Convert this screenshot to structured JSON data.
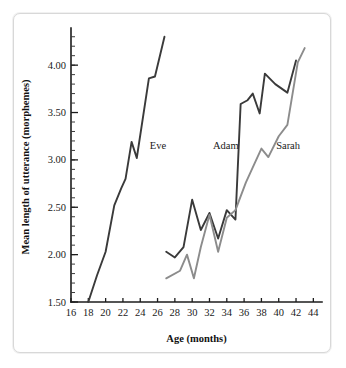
{
  "figure": {
    "frame_color": "#d8d8d8",
    "background": "#ffffff"
  },
  "axis": {
    "x_title": "Age (months)",
    "y_title": "Mean length of utterance (morphemes)",
    "x_ticks": [
      "16",
      "18",
      "20",
      "22",
      "24",
      "26",
      "28",
      "30",
      "32",
      "34",
      "36",
      "38",
      "40",
      "42",
      "44"
    ],
    "y_ticks": [
      "1.50",
      "2.00",
      "2.50",
      "3.00",
      "3.50",
      "4.00"
    ]
  },
  "labels": {
    "eve": "Eve",
    "adam": "Adam",
    "sarah": "Sarah"
  },
  "chart_data": {
    "type": "line",
    "title": "",
    "xlabel": "Age (months)",
    "ylabel": "Mean length of utterance (morphemes)",
    "xlim": [
      16,
      45
    ],
    "ylim": [
      1.5,
      4.35
    ],
    "xticks": [
      16,
      18,
      20,
      22,
      24,
      26,
      28,
      30,
      32,
      34,
      36,
      38,
      40,
      42,
      44
    ],
    "yticks": [
      1.5,
      2.0,
      2.5,
      3.0,
      3.5,
      4.0
    ],
    "y_minor_step": 0.1,
    "grid": false,
    "legend": "inline-labels",
    "series": [
      {
        "name": "Eve",
        "color": "#3a3a3a",
        "label_x": 25.1,
        "label_y": 3.12,
        "points": [
          [
            18.0,
            1.5
          ],
          [
            19.0,
            1.78
          ],
          [
            20.0,
            2.03
          ],
          [
            21.0,
            2.52
          ],
          [
            21.8,
            2.7
          ],
          [
            22.3,
            2.8
          ],
          [
            23.0,
            3.19
          ],
          [
            23.6,
            3.02
          ],
          [
            25.0,
            3.86
          ],
          [
            25.7,
            3.88
          ],
          [
            26.8,
            4.3
          ]
        ]
      },
      {
        "name": "Adam",
        "color": "#3a3a3a",
        "label_x": 32.4,
        "label_y": 3.12,
        "points": [
          [
            27.0,
            2.03
          ],
          [
            28.0,
            1.97
          ],
          [
            29.0,
            2.08
          ],
          [
            30.0,
            2.58
          ],
          [
            31.0,
            2.26
          ],
          [
            32.0,
            2.44
          ],
          [
            33.0,
            2.17
          ],
          [
            34.0,
            2.47
          ],
          [
            35.0,
            2.37
          ],
          [
            35.6,
            3.59
          ],
          [
            36.4,
            3.63
          ],
          [
            37.0,
            3.7
          ],
          [
            37.8,
            3.49
          ],
          [
            38.4,
            3.91
          ],
          [
            39.6,
            3.8
          ],
          [
            41.0,
            3.71
          ],
          [
            42.0,
            4.05
          ]
        ]
      },
      {
        "name": "Sarah",
        "color": "#8c8c8c",
        "label_x": 39.7,
        "label_y": 3.12,
        "points": [
          [
            27.0,
            1.75
          ],
          [
            28.6,
            1.83
          ],
          [
            29.4,
            2.0
          ],
          [
            30.2,
            1.75
          ],
          [
            31.0,
            2.08
          ],
          [
            32.0,
            2.42
          ],
          [
            33.0,
            2.03
          ],
          [
            34.0,
            2.39
          ],
          [
            35.0,
            2.47
          ],
          [
            36.2,
            2.76
          ],
          [
            37.2,
            2.96
          ],
          [
            38.0,
            3.12
          ],
          [
            38.8,
            3.03
          ],
          [
            40.0,
            3.25
          ],
          [
            41.0,
            3.37
          ],
          [
            42.2,
            4.03
          ],
          [
            43.0,
            4.18
          ]
        ]
      }
    ]
  }
}
